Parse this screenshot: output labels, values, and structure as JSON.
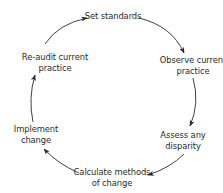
{
  "diagram": {
    "type": "cycle",
    "title": "",
    "colors": {
      "line": "#2a2a2a",
      "text": "#2a2a2a",
      "background": "#ffffff"
    },
    "nodes": [
      {
        "id": "set-standards",
        "lines": [
          "Set standards"
        ]
      },
      {
        "id": "observe-current-practice",
        "lines": [
          "Observe current",
          "practice"
        ]
      },
      {
        "id": "assess-any-disparity",
        "lines": [
          "Assess any",
          "disparity"
        ]
      },
      {
        "id": "calculate-methods-of-change",
        "lines": [
          "Calculate methods",
          "of change"
        ]
      },
      {
        "id": "implement-change",
        "lines": [
          "Implement",
          "change"
        ]
      },
      {
        "id": "re-audit-current-practice",
        "lines": [
          "Re-audit current",
          "practice"
        ]
      }
    ],
    "edges": [
      {
        "from": "set-standards",
        "to": "observe-current-practice"
      },
      {
        "from": "observe-current-practice",
        "to": "assess-any-disparity"
      },
      {
        "from": "assess-any-disparity",
        "to": "calculate-methods-of-change"
      },
      {
        "from": "calculate-methods-of-change",
        "to": "implement-change"
      },
      {
        "from": "implement-change",
        "to": "re-audit-current-practice"
      },
      {
        "from": "re-audit-current-practice",
        "to": "set-standards"
      }
    ]
  }
}
